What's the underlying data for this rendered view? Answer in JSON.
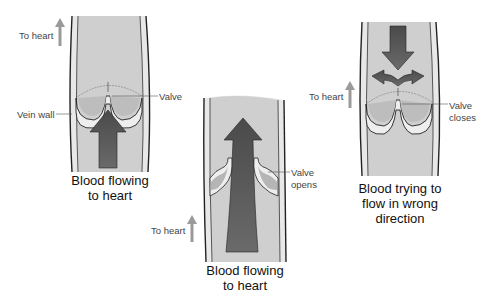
{
  "diagram": {
    "panels": [
      {
        "id": "closed-valve-normal",
        "caption_line1": "Blood flowing",
        "caption_line2": "to heart",
        "direction_label": "To heart",
        "labels": {
          "valve": "Valve",
          "vein_wall": "Vein wall"
        }
      },
      {
        "id": "open-valve",
        "caption_line1": "Blood flowing",
        "caption_line2": "to heart",
        "direction_label": "To heart",
        "labels": {
          "valve_line1": "Valve",
          "valve_line2": "opens"
        }
      },
      {
        "id": "closed-valve-backflow",
        "caption_line1": "Blood trying to",
        "caption_line2": "flow in wrong",
        "caption_line3": "direction",
        "direction_label": "To heart",
        "labels": {
          "valve_line1": "Valve",
          "valve_line2": "closes"
        }
      }
    ],
    "colors": {
      "vein_fill": "#cdcdcd",
      "vein_wall": "#e6e6e6",
      "outline": "#222222",
      "arrow_dark": "#555555",
      "direction_arrow": "#9a9a9a"
    }
  }
}
